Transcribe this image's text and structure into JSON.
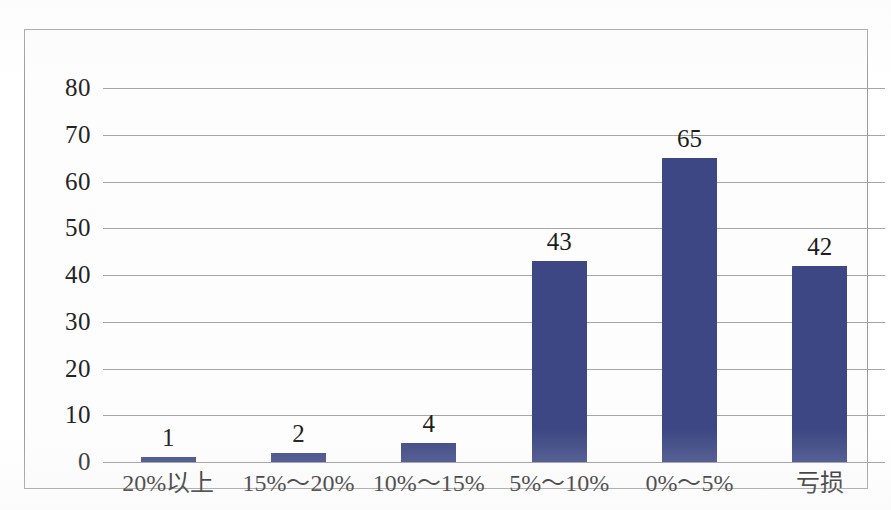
{
  "chart_data": {
    "type": "bar",
    "title": "",
    "subtitle": "",
    "xlabel": "",
    "ylabel": "",
    "categories": [
      "20%以上",
      "15%～20%",
      "10%～15%",
      "5%～10%",
      "0%～5%",
      "亏损"
    ],
    "values": [
      1,
      2,
      4,
      43,
      65,
      42
    ],
    "data_labels": [
      "1",
      "2",
      "4",
      "43",
      "65",
      "42"
    ],
    "ylim": [
      0,
      80
    ],
    "ytick_labels": [
      "0",
      "10",
      "20",
      "30",
      "40",
      "50",
      "60",
      "70",
      "80"
    ],
    "ytick_values": [
      0,
      10,
      20,
      30,
      40,
      50,
      60,
      70,
      80
    ],
    "grid": true,
    "legend": false,
    "legend_position": "none",
    "series": [
      {
        "name": "",
        "values": [
          1,
          2,
          4,
          43,
          65,
          42
        ],
        "color": "#3f4b8a"
      }
    ]
  },
  "style": {
    "bar_color": "#3f4b8a",
    "grid_color": "#a6a6a6",
    "frame_color": "#9a9a9a",
    "text_color": "#1d1d1d",
    "plot_background": "#fdfdfd",
    "page_background": "#ffffff"
  }
}
